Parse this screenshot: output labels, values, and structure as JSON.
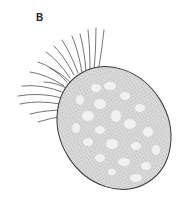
{
  "figure": {
    "panel_label": "B",
    "colors": {
      "outline": "#3a3a3a",
      "stipple": "#8c8c8c",
      "body_fill": "#d9d9d9",
      "vacuole_fill": "#f2f2f2",
      "background": "#ffffff"
    }
  }
}
